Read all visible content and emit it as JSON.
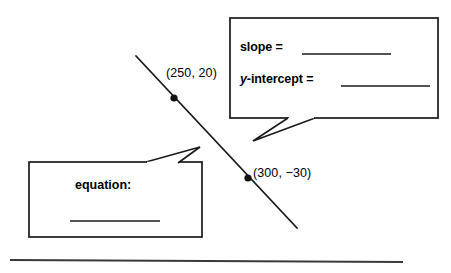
{
  "page": {
    "background_color": "#ffffff",
    "ink_color": "#1a1a1a"
  },
  "graph": {
    "line": {
      "name": "diagonal-line",
      "x1": 136,
      "y1": 56,
      "x2": 297,
      "y2": 228
    },
    "points": [
      {
        "id": "point-1",
        "label": "(250, 20)",
        "dot_x": 174,
        "dot_y": 98,
        "label_x": 166,
        "label_y": 74
      },
      {
        "id": "point-2",
        "label": "(300, −30)",
        "dot_x": 248,
        "dot_y": 178,
        "label_x": 253,
        "label_y": 174
      }
    ],
    "baseline_rule": {
      "name": "bottom-rule",
      "x1": 10,
      "y1": 260,
      "x2": 403,
      "y2": 262
    }
  },
  "callouts": {
    "slope_box": {
      "name": "slope-intercept-callout",
      "x": 230,
      "y": 18,
      "width": 208,
      "height": 100,
      "rows": [
        {
          "id": "slope-row",
          "label_plain": "slope = ",
          "label_italic": "",
          "label_rest": ""
        },
        {
          "id": "y-intercept-row",
          "label_italic": "y",
          "label_rest": "-intercept = "
        }
      ],
      "slope_text": "slope =",
      "y_intercept_italic": "y",
      "y_intercept_rest": "-intercept =",
      "blanks": [
        {
          "id": "slope-blank",
          "x1": 302,
          "y1": 54,
          "x2": 391,
          "y2": 54
        },
        {
          "id": "y-intercept-blank",
          "x1": 341,
          "y1": 86,
          "x2": 430,
          "y2": 86
        }
      ],
      "tail": "M 288 118 L 253 141 L 315 118"
    },
    "equation_box": {
      "name": "equation-callout",
      "x": 29,
      "y": 162,
      "width": 173,
      "height": 75,
      "label": "equation:",
      "label_x": 75,
      "label_y": 179,
      "blank": {
        "id": "equation-blank",
        "x1": 70,
        "y1": 221,
        "x2": 160,
        "y2": 221
      },
      "tail": "M 146 162 L 200 147 L 178 163"
    }
  }
}
